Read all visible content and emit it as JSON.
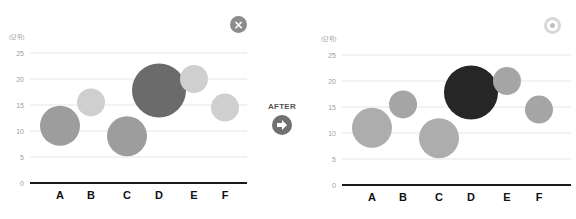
{
  "transition": {
    "label": "AFTER",
    "icon": "arrow-right-circle-icon"
  },
  "colors": {
    "grid": "#e6e6e6",
    "axis": "#1a1a1a",
    "tick_text": "#a0a0a0",
    "category_text": "#111111"
  },
  "chart_data": [
    {
      "type": "bubble",
      "title": "",
      "state": "before",
      "corner_icon": "close-circle-icon",
      "unit_label": "(단위)",
      "xlabel": "",
      "ylabel": "(단위)",
      "ylim": [
        0,
        25
      ],
      "yticks": [
        0,
        5,
        10,
        15,
        20,
        25
      ],
      "grid": true,
      "categories": [
        "A",
        "B",
        "C",
        "D",
        "E",
        "F"
      ],
      "values": [
        11,
        15.5,
        9,
        17.8,
        20,
        14.5
      ],
      "sizes": [
        20,
        14,
        20,
        27,
        14,
        14
      ],
      "colors": [
        "#9d9d9d",
        "#cfcfcf",
        "#9d9d9d",
        "#6b6b6b",
        "#cfcfcf",
        "#cfcfcf"
      ]
    },
    {
      "type": "bubble",
      "title": "",
      "state": "after",
      "corner_icon": "target-circle-icon",
      "unit_label": "(단위)",
      "xlabel": "",
      "ylabel": "(단위)",
      "ylim": [
        0,
        25
      ],
      "yticks": [
        0,
        5,
        10,
        15,
        20,
        25
      ],
      "grid": true,
      "categories": [
        "A",
        "B",
        "C",
        "D",
        "E",
        "F"
      ],
      "values": [
        11,
        15.5,
        9,
        17.8,
        20,
        14.5
      ],
      "sizes": [
        20,
        14,
        20,
        27,
        14,
        14
      ],
      "colors": [
        "#adadad",
        "#a5a5a5",
        "#adadad",
        "#262626",
        "#a5a5a5",
        "#a5a5a5"
      ]
    }
  ]
}
